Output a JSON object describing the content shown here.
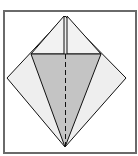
{
  "diagram": {
    "type": "origami-fold-step",
    "colors": {
      "frame": "#6a6a6a",
      "paper_light": "#eeeeee",
      "paper_shaded": "#c4c4c4",
      "line": "#111111"
    },
    "elements": [
      "outer square frame",
      "diamond (kite) outline",
      "top flaps with vertical center gap",
      "shaded inverted triangle",
      "dashed center fold line (valley fold)"
    ]
  }
}
